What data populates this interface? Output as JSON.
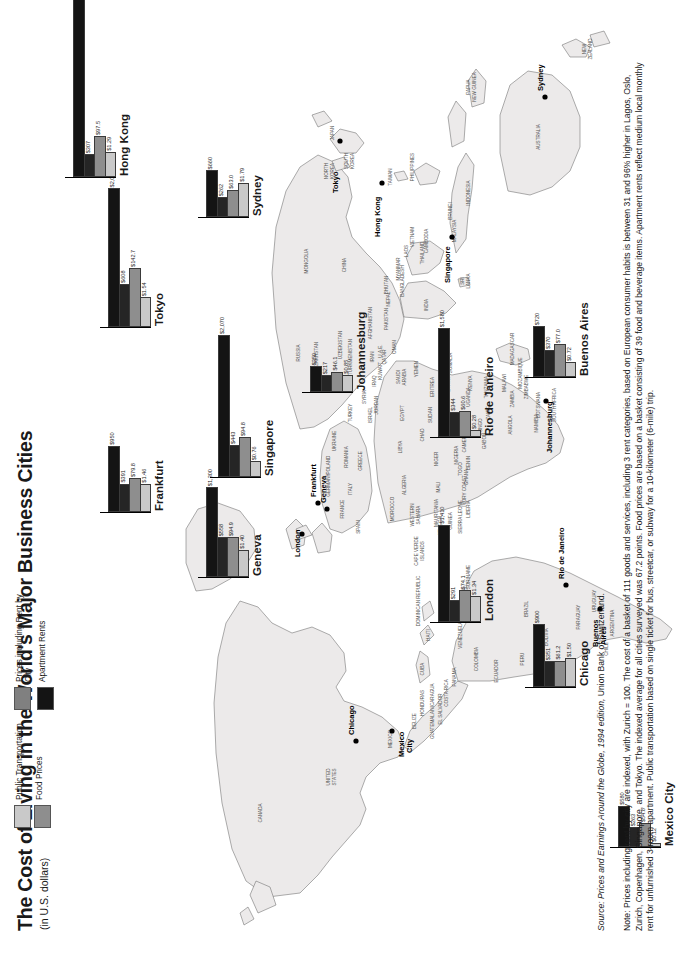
{
  "header": {
    "title": "The Cost of Living in the World's Major Business Cities",
    "subtitle": "(in U.S. dollars)"
  },
  "legend": {
    "items": [
      {
        "label": "Public Transportation",
        "color": "#c9c9c9",
        "key": "transport"
      },
      {
        "label": "Food Prices",
        "color": "#8e8e8e",
        "key": "food"
      },
      {
        "label": "Prices including Rent by City",
        "color": "#808080",
        "key": "price_index"
      },
      {
        "label": "Apartment Rents",
        "color": "#141414",
        "key": "rent"
      }
    ]
  },
  "footer": {
    "source_prefix": "Source: ",
    "source_italic": "Prices and Earnings Around the Globe, 1994 edition,",
    "source_suffix": " Union Bank of Switzerland.",
    "note": "Note: Prices including rent by city are indexed, with Zurich = 100. The cost of a basket of 111 goods and services, including 3 rent categories, based on European consumer habits is between 31 and 96% higher in Lagos, Oslo, Zurich, Copenhagen, Singapore, and Tokyo. The indexed average for all cities surveyed was 67.2 points. Food prices are based on a basket consisting of 39 food and beverage items. Apartment rents reflect medium local monthly rent for unfurnished 3-room apartment. Public transportation based on single ticket for bus, streetcar, or subway for a 10-kilometer (6-mile) trip."
  },
  "chart_data": {
    "type": "bar",
    "title": "The Cost of Living in the World's Major Business Cities",
    "subtitle": "(in U.S. dollars)",
    "categories": [
      "Mexico City",
      "Chicago",
      "London",
      "Buenos Aires",
      "Rio de Janeiro",
      "Frankfurt",
      "Geneva",
      "Johannesburg",
      "Singapore",
      "Sydney",
      "Tokyo",
      "Hong Kong"
    ],
    "series": [
      {
        "name": "Public Transportation",
        "color": "#c9c9c9",
        "values": [
          0.12,
          1.5,
          1.34,
          0.72,
          0.28,
          1.46,
          1.4,
          0.85,
          0.76,
          1.79,
          1.54,
          1.29
        ],
        "labels": [
          "$0.12",
          "$1.50",
          "$1.34",
          "$0.72",
          "$0.28",
          "$1.46",
          "$1.40",
          "$0.85",
          "$0.76",
          "$1.79",
          "$1.54",
          "$1.29"
        ]
      },
      {
        "name": "Prices including Rent by City",
        "color": "#808080",
        "values": [
          54.6,
          61.2,
          74.1,
          77.0,
          60.6,
          79.8,
          94.9,
          46.1,
          94.8,
          63.0,
          142.7,
          97.5
        ],
        "labels": [
          "$54.6",
          "$61.2",
          "$74.1",
          "$77.0",
          "$60.6",
          "$79.8",
          "$94.9",
          "$46.1",
          "$94.8",
          "$63.0",
          "$142.7",
          "$97.5"
        ]
      },
      {
        "name": "Food Prices",
        "color": "#8e8e8e",
        "values": [
          263,
          351,
          291,
          370,
          344,
          391,
          558,
          217,
          443,
          262,
          608,
          307
        ],
        "labels": [
          "$263",
          "$351",
          "$291",
          "$370",
          "$344",
          "$391",
          "$558",
          "$217",
          "$443",
          "$262",
          "$608",
          "$307"
        ]
      },
      {
        "name": "Apartment Rents",
        "color": "#141414",
        "values": [
          580,
          900,
          1410,
          720,
          1580,
          950,
          1300,
          350,
          2070,
          660,
          2020,
          4260
        ],
        "labels": [
          "$580",
          "$900",
          "$1,410",
          "$720",
          "$1,580",
          "$950",
          "$1,300",
          "$350",
          "$2,070",
          "$660",
          "$2,020",
          "$4,260"
        ]
      }
    ],
    "ylabel": "",
    "xlabel": "",
    "grid": false,
    "legend_position": "top-left"
  },
  "map": {
    "city_markers": [
      "Mexico City",
      "Chicago",
      "London",
      "Frankfurt",
      "Geneva",
      "Buenos Aires",
      "Rio de Janeiro",
      "Johannesburg",
      "Singapore",
      "Hong Kong",
      "Tokyo",
      "Sydney"
    ],
    "country_labels": [
      "CANADA",
      "UNITED STATES",
      "MEXICO",
      "GREENLAND (DENMARK)",
      "CUBA",
      "HAITI",
      "DOMINICAN REPUBLIC",
      "BELIZE",
      "GUATEMALA",
      "EL SALVADOR",
      "HONDURAS",
      "NICARAGUA",
      "COSTA RICA",
      "PANAMA",
      "VENEZUELA",
      "COLOMBIA",
      "GUYANA",
      "SURINAME",
      "ECUADOR",
      "PERU",
      "BRAZIL",
      "BOLIVIA",
      "PARAGUAY",
      "CHILE",
      "ARGENTINA",
      "URUGUAY",
      "CAPE VERDE ISLANDS",
      "MOROCCO",
      "WESTERN SAHARA",
      "MAURITANIA",
      "MALI",
      "NIGER",
      "ALGERIA",
      "LIBYA",
      "EGYPT",
      "SUDAN",
      "CHAD",
      "NIGERIA",
      "SENEGAL",
      "GUINEA",
      "SIERRA LEONE",
      "LIBERIA",
      "IVORY COAST",
      "GHANA",
      "TOGO",
      "BENIN",
      "CAMEROON",
      "GABON",
      "CONGO",
      "ZAIRE",
      "ANGOLA",
      "ZAMBIA",
      "NAMIBIA",
      "BOTSWANA",
      "ZIMBABWE",
      "MOZAMBIQUE",
      "MALAWI",
      "TANZANIA",
      "KENYA",
      "UGANDA",
      "ETHIOPIA",
      "SOMALIA",
      "ERITREA",
      "SOUTH AFRICA",
      "MADAGASCAR",
      "RUSSIA",
      "MONGOLIA",
      "CHINA",
      "INDIA",
      "KAZAKHSTAN",
      "UZBEKISTAN",
      "TURKMENISTAN",
      "IRAN",
      "IRAQ",
      "SAUDI ARABIA",
      "OMAN",
      "YEMEN",
      "TURKEY",
      "SYRIA",
      "JORDAN",
      "ISRAEL",
      "KUWAIT",
      "QATAR",
      "U.A.E.",
      "AFGHANISTAN",
      "PAKISTAN",
      "NEPAL",
      "BHUTAN",
      "BANGLADESH",
      "MYANMAR",
      "THAILAND",
      "LAOS",
      "CAMBODIA",
      "VIETNAM",
      "MALAYSIA",
      "INDONESIA",
      "PHILIPPINES",
      "BRUNEI",
      "TAIWAN",
      "NORTH KOREA",
      "SOUTH KOREA",
      "JAPAN",
      "SRI LANKA",
      "PAPUA NEW GUINEA",
      "AUSTRALIA",
      "NEW ZEALAND",
      "GERMANY",
      "FRANCE",
      "SPAIN",
      "ITALY",
      "POLAND",
      "UKRAINE",
      "ROMANIA",
      "GREECE"
    ]
  }
}
